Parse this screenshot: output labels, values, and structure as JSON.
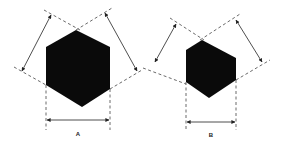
{
  "figures": [
    {
      "id": "A",
      "label": "A",
      "shape": "hexagon",
      "description": "Regular hexagon with dimension arrows between parallel dashed tangent lines"
    },
    {
      "id": "B",
      "label": "B",
      "shape": "hexagon",
      "description": "Irregular/smaller hexagon with dimension arrows between parallel dashed tangent lines"
    }
  ],
  "colors": {
    "fill": "#0a0a0a",
    "line": "#333333",
    "background": "#ffffff"
  }
}
